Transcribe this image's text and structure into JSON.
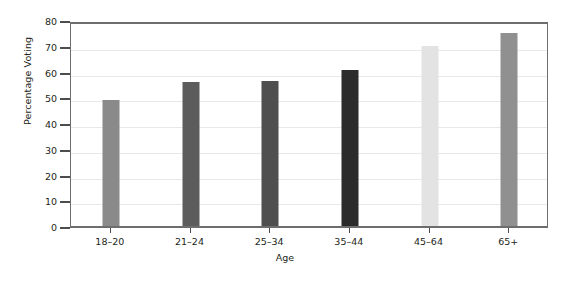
{
  "chart_data": {
    "type": "bar",
    "title": "",
    "xlabel": "Age",
    "ylabel": "Percentage Voting",
    "categories": [
      "18–20",
      "21–24",
      "25–34",
      "35–44",
      "45–64",
      "65+"
    ],
    "values": [
      49,
      56,
      56.5,
      60.5,
      70,
      75
    ],
    "bar_colors": [
      "#8a8a8a",
      "#5c5c5c",
      "#4f4f4f",
      "#2b2b2b",
      "#e3e3e3",
      "#909090"
    ],
    "ylim": [
      0,
      80
    ],
    "yticks": [
      0,
      10,
      20,
      30,
      40,
      50,
      60,
      70,
      80
    ],
    "ytick_labels": [
      "0",
      "10",
      "20",
      "30",
      "40",
      "50",
      "60",
      "70",
      "80"
    ],
    "grid": true,
    "grid_color": "#e8e8e8",
    "legend": "none",
    "frame_color": "#6d6d6d",
    "background": "#ffffff"
  }
}
